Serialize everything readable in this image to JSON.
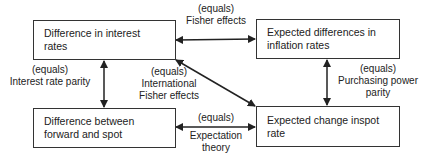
{
  "nodes": {
    "interest": "Difference in interest rates",
    "inflation": "Expected differences in inflation rates",
    "forward_spot": "Difference between forward and spot",
    "spot_change": "Expected change inspot rate"
  },
  "edges": {
    "fisher": {
      "line1": "(equals)",
      "line2": "Fisher effects"
    },
    "irp": {
      "line1": "(equals)",
      "line2": "Interest rate parity"
    },
    "ife": {
      "line1": "(equals)",
      "line2": "International",
      "line3": "Fisher effects"
    },
    "ppp": {
      "line1": "(equals)",
      "line2": "Purchasing power",
      "line3": "parity"
    },
    "exp": {
      "line1": "(equals)",
      "line2": "Expectation",
      "line3": "theory"
    }
  },
  "colors": {
    "line": "#222222",
    "border": "#333333"
  }
}
